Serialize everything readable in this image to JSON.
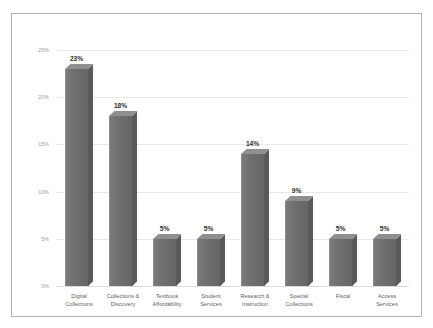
{
  "chart_data": {
    "type": "bar",
    "title": "",
    "subtitle": "",
    "xlabel": "",
    "ylabel": "",
    "categories": [
      "Digital\nCollections",
      "Collections &\nDiscovery",
      "Textbook\nAffordability",
      "Student\nServices",
      "Research &\nInstruction",
      "Special\nCollections",
      "Fiscal",
      "Access\nServices"
    ],
    "values": [
      23,
      18,
      5,
      5,
      14,
      9,
      5,
      5
    ],
    "data_labels": [
      "23%",
      "18%",
      "5%",
      "5%",
      "14%",
      "9%",
      "5%",
      "5%"
    ],
    "ylim": [
      0,
      25
    ],
    "ytick_values": [
      0,
      5,
      10,
      15,
      20,
      25
    ],
    "ytick_labels": [
      "0%",
      "5%",
      "10%",
      "15%",
      "20%",
      "25%"
    ],
    "grid": true,
    "legend": false,
    "legend_position": "none",
    "bar_style": "3d-column",
    "series": [
      {
        "name": "",
        "values": [
          23,
          18,
          5,
          5,
          14,
          9,
          5,
          5
        ]
      }
    ]
  },
  "colors": {
    "bar_front": "#6d6d6d",
    "bar_top": "#8f8f8f",
    "bar_side": "#5a5a5a",
    "gridline": "#e9e9e9",
    "axis_text": "#9a9a9a",
    "category_text": "#5f5f5f",
    "data_label_text": "#2e2e2e",
    "frame_border": "#b0b0b0",
    "background": "#ffffff"
  }
}
